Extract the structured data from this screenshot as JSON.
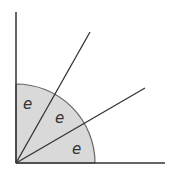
{
  "diagram": {
    "origin": [
      16,
      163
    ],
    "radius": 79,
    "colors": {
      "line": "#333333",
      "sector_fill": "#d9d9d9",
      "arc": "#666666"
    },
    "axes": {
      "vertical_end": [
        16,
        12
      ],
      "horizontal_end": [
        165,
        163
      ]
    },
    "rays": [
      {
        "name": "ray-60deg",
        "end": [
          90,
          32
        ]
      },
      {
        "name": "ray-30deg",
        "end": [
          145,
          88
        ]
      }
    ],
    "sector_labels": [
      {
        "text": "e",
        "x": 28,
        "y": 109
      },
      {
        "text": "e",
        "x": 60,
        "y": 123
      },
      {
        "text": "e",
        "x": 77,
        "y": 154
      }
    ]
  }
}
